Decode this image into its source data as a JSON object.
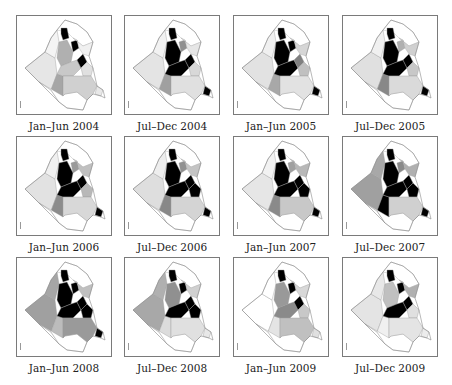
{
  "figure": {
    "panels": [
      {
        "label": "Jan–Jun 2004",
        "shades": {
          "nw": "#f4f4f4",
          "w": "#e6e6e6",
          "s": "#ffffff",
          "sw": "#a6a6a6",
          "n1": "#000000",
          "n2": "#000000",
          "c1": "#b0b0b0",
          "c2": "#c8c8c8",
          "c3": "#000000",
          "e1": "#f0f0f0",
          "e2": "#e0e0e0",
          "se": "#d0d0d0",
          "tip": "#e8e8e8",
          "ne": "#ffffff"
        }
      },
      {
        "label": "Jul–Dec 2004",
        "shades": {
          "nw": "#f2f2f2",
          "w": "#e4e4e4",
          "s": "#ffffff",
          "sw": "#a0a0a0",
          "n1": "#000000",
          "n2": "#909090",
          "c1": "#000000",
          "c2": "#000000",
          "c3": "#000000",
          "e1": "#e6e6e6",
          "e2": "#d8d8d8",
          "se": "#e0e0e0",
          "tip": "#000000",
          "ne": "#ffffff"
        }
      },
      {
        "label": "Jan–Jun 2005",
        "shades": {
          "nw": "#f0f0f0",
          "w": "#e2e2e2",
          "s": "#ffffff",
          "sw": "#a8a8a8",
          "n1": "#000000",
          "n2": "#000000",
          "c1": "#000000",
          "c2": "#000000",
          "c3": "#808080",
          "e1": "#d6d6d6",
          "e2": "#c0c0c0",
          "se": "#e2e2e2",
          "tip": "#000000",
          "ne": "#ffffff"
        }
      },
      {
        "label": "Jul–Dec 2005",
        "shades": {
          "nw": "#f0f0f0",
          "w": "#e0e0e0",
          "s": "#ffffff",
          "sw": "#888888",
          "n1": "#000000",
          "n2": "#b0b0b0",
          "c1": "#000000",
          "c2": "#000000",
          "c3": "#000000",
          "e1": "#d0d0d0",
          "e2": "#c8c8c8",
          "se": "#dadada",
          "tip": "#000000",
          "ne": "#ffffff"
        }
      },
      {
        "label": "Jan–Jun 2006",
        "shades": {
          "nw": "#f0f0f0",
          "w": "#e2e2e2",
          "s": "#ffffff",
          "sw": "#8c8c8c",
          "n1": "#000000",
          "n2": "#9a9a9a",
          "c1": "#000000",
          "c2": "#000000",
          "c3": "#000000",
          "e1": "#c0c0c0",
          "e2": "#b8b8b8",
          "se": "#d8d8d8",
          "tip": "#000000",
          "ne": "#ffffff"
        }
      },
      {
        "label": "Jul–Dec 2006",
        "shades": {
          "nw": "#eeeeee",
          "w": "#dedede",
          "s": "#ffffff",
          "sw": "#888888",
          "n1": "#000000",
          "n2": "#909090",
          "c1": "#000000",
          "c2": "#000000",
          "c3": "#000000",
          "e1": "#c4c4c4",
          "e2": "#000000",
          "se": "#d4d4d4",
          "tip": "#000000",
          "ne": "#ffffff"
        }
      },
      {
        "label": "Jan–Jun 2007",
        "shades": {
          "nw": "#f2f2f2",
          "w": "#e6e6e6",
          "s": "#ffffff",
          "sw": "#8a8a8a",
          "n1": "#000000",
          "n2": "#a0a0a0",
          "c1": "#000000",
          "c2": "#000000",
          "c3": "#000000",
          "e1": "#b8b8b8",
          "e2": "#000000",
          "se": "#c8c8c8",
          "tip": "#000000",
          "ne": "#ffffff"
        }
      },
      {
        "label": "Jul–Dec 2007",
        "shades": {
          "nw": "#a8a8a8",
          "w": "#a0a0a0",
          "s": "#ffffff",
          "sw": "#000000",
          "n1": "#000000",
          "n2": "#8a8a8a",
          "c1": "#000000",
          "c2": "#000000",
          "c3": "#000000",
          "e1": "#b0b0b0",
          "e2": "#000000",
          "se": "#d0d0d0",
          "tip": "#000000",
          "ne": "#ffffff"
        }
      },
      {
        "label": "Jan–Jun 2008",
        "shades": {
          "nw": "#a6a6a6",
          "w": "#a0a0a0",
          "s": "#ffffff",
          "sw": "#bcbcbc",
          "n1": "#000000",
          "n2": "#000000",
          "c1": "#000000",
          "c2": "#000000",
          "c3": "#000000",
          "e1": "#c0c0c0",
          "e2": "#000000",
          "se": "#9a9a9a",
          "tip": "#000000",
          "ne": "#ffffff"
        }
      },
      {
        "label": "Jul–Dec 2008",
        "shades": {
          "nw": "#b0b0b0",
          "w": "#a8a8a8",
          "s": "#ffffff",
          "sw": "#dcdcdc",
          "n1": "#000000",
          "n2": "#000000",
          "c1": "#909090",
          "c2": "#000000",
          "c3": "#000000",
          "e1": "#d0d0d0",
          "e2": "#000000",
          "se": "#e0e0e0",
          "tip": "#e8e8e8",
          "ne": "#ffffff"
        }
      },
      {
        "label": "Jan–Jun 2009",
        "shades": {
          "nw": "#ffffff",
          "w": "#ffffff",
          "s": "#ffffff",
          "sw": "#e4e4e4",
          "n1": "#000000",
          "n2": "#000000",
          "c1": "#999999",
          "c2": "#8a8a8a",
          "c3": "#000000",
          "e1": "#d8d8d8",
          "e2": "#c8c8c8",
          "se": "#c0c0c0",
          "tip": "#e0e0e0",
          "ne": "#ffffff"
        }
      },
      {
        "label": "Jul–Dec 2009",
        "shades": {
          "nw": "#e8e8e8",
          "w": "#e4e4e4",
          "s": "#ffffff",
          "sw": "#f0f0f0",
          "n1": "#000000",
          "n2": "#000000",
          "c1": "#c0c0c0",
          "c2": "#000000",
          "c3": "#000000",
          "e1": "#b0b0b0",
          "e2": "#e0e0e0",
          "se": "#e4e4e4",
          "tip": "#ececec",
          "ne": "#ffffff"
        }
      }
    ],
    "border_color": "#7a7a7a",
    "outline_color": "#888888"
  }
}
